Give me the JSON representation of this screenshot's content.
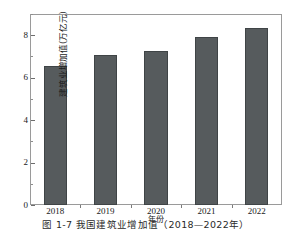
{
  "caption": "图 1-7  我国建筑业增加值（2018—2022年）",
  "chart_data": {
    "type": "bar",
    "title": "",
    "categories": [
      "2018",
      "2019",
      "2020",
      "2021",
      "2022"
    ],
    "values": [
      6.55,
      7.05,
      7.25,
      7.9,
      8.35
    ],
    "xlabel": "年份",
    "ylabel": "建筑业增加值(万亿元)",
    "ylim": [
      0,
      9
    ],
    "ytick_labels": [
      "0",
      "2",
      "4",
      "6",
      "8"
    ],
    "ytick_values": [
      0,
      2,
      4,
      6,
      8
    ],
    "yminor_values": [
      1,
      3,
      5,
      7,
      9
    ],
    "grid": false,
    "legend": "none",
    "bar_color": "#565b5d",
    "bar_edge_color": "#3f4446",
    "frame_color": "#9a9a9a",
    "background": "#ffffff"
  }
}
